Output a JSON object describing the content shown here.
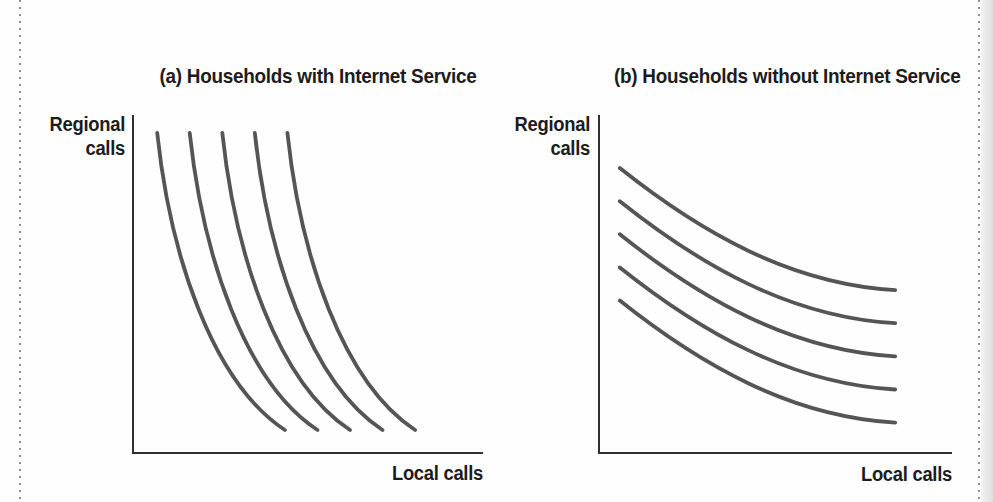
{
  "figure": {
    "kind": "scanned textbook figure, two-panel indifference-curve diagram",
    "background": "#fefefe"
  },
  "colors": {
    "text": "#1c1c1c",
    "axis": "#303030",
    "curve": "#555555",
    "dotted_border": "#909090",
    "page_edge_shade": "#dedede"
  },
  "chart_data": [
    {
      "type": "line",
      "subtype": "indifference-curves",
      "panel": "a",
      "title": "(a) Households with Internet Service",
      "xlabel": "Local calls",
      "ylabel": "Regional\ncalls",
      "x_range": [
        0,
        1
      ],
      "y_range": [
        0,
        1
      ],
      "ticks": "none",
      "grid": false,
      "legend": false,
      "description": "Five steep, downward-sloping indifference curves convex to the origin: regional and local calls are weak substitutes.",
      "series": [
        {
          "name": "curve-1",
          "bezier": [
            [
              0.069,
              0.947
            ],
            [
              0.106,
              0.586
            ],
            [
              0.226,
              0.21
            ],
            [
              0.434,
              0.068
            ]
          ]
        },
        {
          "name": "curve-2",
          "bezier": [
            [
              0.162,
              0.947
            ],
            [
              0.199,
              0.586
            ],
            [
              0.319,
              0.21
            ],
            [
              0.527,
              0.068
            ]
          ]
        },
        {
          "name": "curve-3",
          "bezier": [
            [
              0.255,
              0.947
            ],
            [
              0.292,
              0.586
            ],
            [
              0.412,
              0.21
            ],
            [
              0.62,
              0.068
            ]
          ]
        },
        {
          "name": "curve-4",
          "bezier": [
            [
              0.348,
              0.947
            ],
            [
              0.385,
              0.586
            ],
            [
              0.505,
              0.21
            ],
            [
              0.713,
              0.068
            ]
          ]
        },
        {
          "name": "curve-5",
          "bezier": [
            [
              0.441,
              0.947
            ],
            [
              0.478,
              0.586
            ],
            [
              0.598,
              0.21
            ],
            [
              0.806,
              0.068
            ]
          ]
        }
      ]
    },
    {
      "type": "line",
      "subtype": "indifference-curves",
      "panel": "b",
      "title": "(b) Households without Internet Service",
      "xlabel": "Local calls",
      "ylabel": "Regional\ncalls",
      "x_range": [
        0,
        1
      ],
      "y_range": [
        0,
        1
      ],
      "ticks": "none",
      "grid": false,
      "legend": false,
      "description": "Five flat, downward-sloping indifference curves: regional and local calls are close substitutes.",
      "series": [
        {
          "name": "curve-1",
          "bezier": [
            [
              0.059,
              0.843
            ],
            [
              0.286,
              0.654
            ],
            [
              0.541,
              0.5
            ],
            [
              0.839,
              0.482
            ]
          ]
        },
        {
          "name": "curve-2",
          "bezier": [
            [
              0.059,
              0.745
            ],
            [
              0.286,
              0.556
            ],
            [
              0.541,
              0.402
            ],
            [
              0.839,
              0.384
            ]
          ]
        },
        {
          "name": "curve-3",
          "bezier": [
            [
              0.059,
              0.647
            ],
            [
              0.286,
              0.458
            ],
            [
              0.541,
              0.304
            ],
            [
              0.839,
              0.286
            ]
          ]
        },
        {
          "name": "curve-4",
          "bezier": [
            [
              0.059,
              0.549
            ],
            [
              0.286,
              0.36
            ],
            [
              0.541,
              0.206
            ],
            [
              0.839,
              0.188
            ]
          ]
        },
        {
          "name": "curve-5",
          "bezier": [
            [
              0.059,
              0.451
            ],
            [
              0.286,
              0.262
            ],
            [
              0.541,
              0.108
            ],
            [
              0.839,
              0.09
            ]
          ]
        }
      ]
    }
  ]
}
